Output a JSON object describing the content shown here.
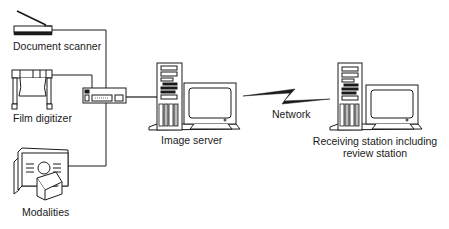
{
  "diagram": {
    "type": "network-topology",
    "nodes": {
      "document_scanner": {
        "label": "Document scanner"
      },
      "film_digitizer": {
        "label": "Film digitizer"
      },
      "modalities": {
        "label": "Modalities"
      },
      "hub": {
        "label": ""
      },
      "image_server": {
        "label": "Image server"
      },
      "network": {
        "label": "Network"
      },
      "receiving_station": {
        "label_line1": "Receiving station including",
        "label_line2": "review station"
      }
    },
    "edges": [
      {
        "from": "document_scanner",
        "to": "hub"
      },
      {
        "from": "film_digitizer",
        "to": "hub"
      },
      {
        "from": "modalities",
        "to": "hub"
      },
      {
        "from": "hub",
        "to": "image_server"
      },
      {
        "from": "image_server",
        "to": "receiving_station",
        "via": "network"
      }
    ],
    "colors": {
      "line": "#1a1a1a",
      "fill": "#ffffff",
      "shade": "#d9d9d9"
    }
  }
}
